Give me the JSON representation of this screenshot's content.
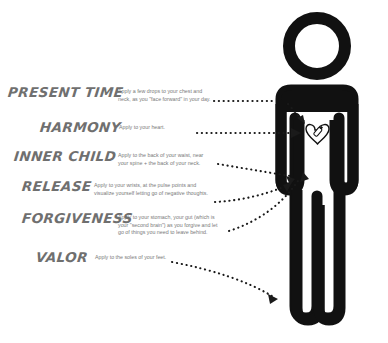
{
  "poster": {
    "background_color": "#ffffff",
    "figure_color": "#111111",
    "text_color": "#7a7a7a",
    "arrow_color": "#1a1a1a"
  },
  "entries": [
    {
      "name": "PRESENT TIME",
      "description": "Apply a few drops to your chest and neck, as you \"face forward\" in your day.",
      "target": "chest-and-neck"
    },
    {
      "name": "HARMONY",
      "description": "Apply to your heart.",
      "target": "heart"
    },
    {
      "name": "INNER CHILD",
      "description": "Apply to the back of your waist, near your spine + the back of your neck.",
      "target": "back-of-waist"
    },
    {
      "name": "RELEASE",
      "description": "Apply to your wrists, at the pulse points and visualize yourself letting go of negative thoughts.",
      "target": "wrists"
    },
    {
      "name": "FORGIVENESS",
      "description": "Apply to your stomach, your gut (which is your \"second brain\") as you forgive and let go of things you need to leave behind.",
      "target": "stomach"
    },
    {
      "name": "VALOR",
      "description": "Apply to the soles of your feet.",
      "target": "soles-of-feet"
    }
  ],
  "figure": {
    "label": "human-body-silhouette",
    "heart_icon_label": "heart-with-oil-bottle-icon"
  }
}
